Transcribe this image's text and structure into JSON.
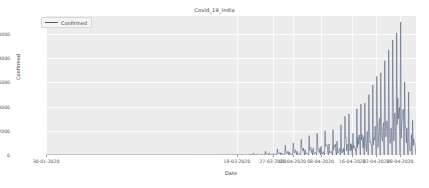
{
  "chart_data": {
    "type": "line",
    "title": "Covid_19_India",
    "xlabel": "Date",
    "ylabel": "Confirmed",
    "legend": [
      {
        "name": "Confirmed",
        "color": "#4a5a78"
      }
    ],
    "legend_position": "upper-left",
    "grid": true,
    "ylim": [
      0,
      11500
    ],
    "yticks": [
      0,
      2000,
      4000,
      6000,
      8000,
      10000
    ],
    "ytick_labels": [
      "0",
      "2000",
      "4000",
      "6000",
      "8000",
      "10000"
    ],
    "xticks": [
      0,
      48,
      57,
      62,
      69,
      77,
      83,
      89
    ],
    "xtick_labels": [
      "30-01-2020",
      "18-03-2020",
      "27-03-2020",
      "01-04-2020",
      "08-04-2020",
      "16-04-2020",
      "22-04-2020",
      "28-04-2020"
    ],
    "xlim": [
      0,
      93
    ],
    "series": [
      {
        "name": "Confirmed",
        "color": "#4a5a78",
        "x": [
          0,
          1,
          2,
          3,
          4,
          5,
          6,
          7,
          8,
          9,
          10,
          11,
          12,
          13,
          14,
          15,
          16,
          17,
          18,
          19,
          20,
          21,
          22,
          23,
          24,
          25,
          26,
          27,
          28,
          29,
          30,
          31,
          32,
          33,
          34,
          35,
          36,
          37,
          38,
          39,
          40,
          41,
          42,
          43,
          44,
          45,
          46,
          47,
          48,
          49,
          50,
          51,
          52,
          53,
          54,
          55,
          56,
          57,
          58,
          59,
          60,
          61,
          62,
          63,
          64,
          65,
          66,
          67,
          68,
          69,
          70,
          71,
          72,
          73,
          74,
          75,
          76,
          77,
          78,
          79,
          80,
          81,
          82,
          83,
          84,
          85,
          86,
          87,
          88,
          89,
          90,
          91,
          92,
          93
        ],
        "values": [
          1,
          0,
          1,
          0,
          0,
          1,
          0,
          0,
          0,
          0,
          0,
          0,
          0,
          0,
          0,
          0,
          0,
          0,
          0,
          0,
          0,
          0,
          0,
          0,
          0,
          0,
          0,
          0,
          0,
          1,
          0,
          2,
          0,
          3,
          0,
          5,
          0,
          6,
          0,
          8,
          0,
          11,
          0,
          15,
          0,
          20,
          0,
          28,
          0,
          40,
          0,
          55,
          0,
          75,
          0,
          100,
          0,
          130,
          0,
          170,
          0,
          230,
          0,
          310,
          0,
          420,
          0,
          560,
          0,
          720,
          0,
          900,
          0,
          1150,
          0,
          1450,
          0,
          1800,
          0,
          2100,
          0,
          2450,
          0,
          2800,
          0,
          3300,
          0,
          3900,
          0,
          4500,
          0,
          5200,
          0,
          6000
        ],
        "peaks": [
          {
            "index": 48,
            "value": 60
          },
          {
            "index": 52,
            "value": 160
          },
          {
            "index": 55,
            "value": 320
          },
          {
            "index": 58,
            "value": 500
          },
          {
            "index": 60,
            "value": 800
          },
          {
            "index": 62,
            "value": 1000
          },
          {
            "index": 64,
            "value": 1300
          },
          {
            "index": 66,
            "value": 1600
          },
          {
            "index": 68,
            "value": 1800
          },
          {
            "index": 70,
            "value": 2000
          },
          {
            "index": 72,
            "value": 2100
          },
          {
            "index": 74,
            "value": 2500
          },
          {
            "index": 75,
            "value": 3200
          },
          {
            "index": 76,
            "value": 3400
          },
          {
            "index": 78,
            "value": 3800
          },
          {
            "index": 79,
            "value": 4200
          },
          {
            "index": 80,
            "value": 4300
          },
          {
            "index": 81,
            "value": 5000
          },
          {
            "index": 82,
            "value": 5800
          },
          {
            "index": 83,
            "value": 6500
          },
          {
            "index": 84,
            "value": 6800
          },
          {
            "index": 85,
            "value": 7800
          },
          {
            "index": 86,
            "value": 8700
          },
          {
            "index": 87,
            "value": 9500
          },
          {
            "index": 88,
            "value": 10100
          },
          {
            "index": 89,
            "value": 11000
          },
          {
            "index": 91,
            "value": 4600
          }
        ],
        "note": "Daily confirmed cases per Indian state/day; dense vertical spikes with exponentially rising envelope."
      }
    ]
  }
}
